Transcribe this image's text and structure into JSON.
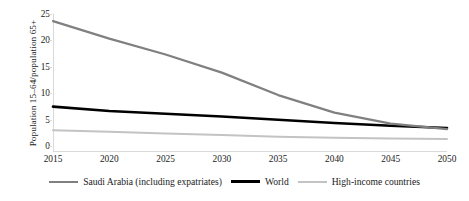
{
  "chart_data": {
    "type": "line",
    "title": "",
    "xlabel": "",
    "ylabel": "Population 15–64/population 65+",
    "x": [
      2015,
      2020,
      2025,
      2030,
      2035,
      2040,
      2045,
      2050
    ],
    "xlim": [
      2015,
      2050
    ],
    "ylim": [
      0,
      25
    ],
    "yticks": [
      0,
      5,
      10,
      15,
      20,
      25
    ],
    "xticks": [
      "2015",
      "2020",
      "2025",
      "2030",
      "2035",
      "2040",
      "2045",
      "2050"
    ],
    "grid": false,
    "legend_position": "bottom",
    "series": [
      {
        "name": "Saudi Arabia (including expatriates)",
        "color": "#808080",
        "width": 2.2,
        "values": [
          23.7,
          20.5,
          17.6,
          14.3,
          10.2,
          7.0,
          5.0,
          4.0
        ]
      },
      {
        "name": "World",
        "color": "#000000",
        "width": 2.6,
        "values": [
          8.1,
          7.3,
          6.8,
          6.3,
          5.7,
          5.1,
          4.6,
          4.2
        ]
      },
      {
        "name": "High-income countries",
        "color": "#c3c3c3",
        "width": 2.0,
        "values": [
          3.8,
          3.5,
          3.2,
          2.9,
          2.6,
          2.4,
          2.3,
          2.2
        ]
      }
    ]
  },
  "axis": {
    "y_title": "Population 15–64/population 65+",
    "y_ticks": [
      "25",
      "20",
      "15",
      "10",
      "5",
      "0"
    ],
    "x_ticks": [
      "2015",
      "2020",
      "2025",
      "2030",
      "2035",
      "2040",
      "2045",
      "2050"
    ]
  },
  "legend": {
    "items": [
      {
        "label": "Saudi Arabia (including expatriates)",
        "color": "#808080"
      },
      {
        "label": "World",
        "color": "#000000"
      },
      {
        "label": "High-income countries",
        "color": "#c3c3c3"
      }
    ]
  },
  "colors": {
    "saudi": "#808080",
    "world": "#000000",
    "high_income": "#c3c3c3",
    "axis": "#d9d9d9",
    "text": "#1a1a1a",
    "background": "#ffffff"
  }
}
